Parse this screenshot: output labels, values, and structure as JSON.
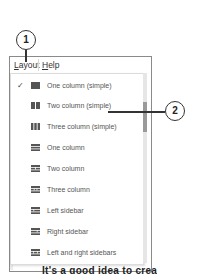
{
  "menubar": {
    "items": [
      {
        "label": "Layout",
        "mnemonic": "L",
        "rest": "ayout",
        "active": true
      },
      {
        "label": "Help",
        "mnemonic": "H",
        "rest": "elp",
        "active": false
      }
    ]
  },
  "layout_menu": {
    "items": [
      {
        "label": "One column (simple)",
        "checked": true,
        "icon": "one-column-simple-icon",
        "check_glyph": "✓"
      },
      {
        "label": "Two column (simple)",
        "checked": false,
        "icon": "two-column-simple-icon"
      },
      {
        "label": "Three column (simple)",
        "checked": false,
        "icon": "three-column-simple-icon"
      },
      {
        "label": "One column",
        "checked": false,
        "icon": "one-column-icon"
      },
      {
        "label": "Two column",
        "checked": false,
        "icon": "two-column-icon"
      },
      {
        "label": "Three column",
        "checked": false,
        "icon": "three-column-icon"
      },
      {
        "label": "Left sidebar",
        "checked": false,
        "icon": "left-sidebar-icon"
      },
      {
        "label": "Right sidebar",
        "checked": false,
        "icon": "right-sidebar-icon"
      },
      {
        "label": "Left and right sidebars",
        "checked": false,
        "icon": "left-right-sidebars-icon"
      }
    ]
  },
  "callouts": [
    {
      "number": "1"
    },
    {
      "number": "2"
    }
  ],
  "background_text": "It's a good idea to crea",
  "colors": {
    "icon": "#555555",
    "text": "#555555",
    "callout_stroke": "#333333"
  }
}
